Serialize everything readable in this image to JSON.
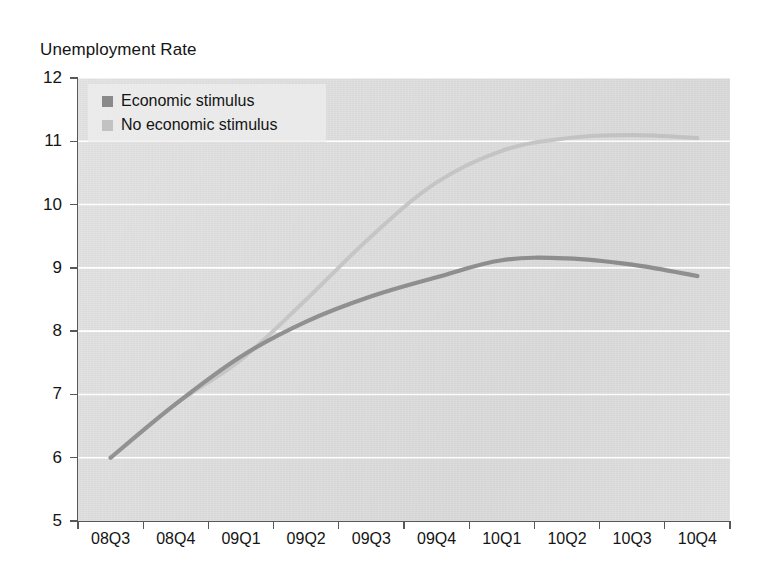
{
  "chart_data": {
    "type": "line",
    "title": "Unemployment Rate",
    "xlabel": "",
    "ylabel": "",
    "categories": [
      "08Q3",
      "08Q4",
      "09Q1",
      "09Q2",
      "09Q3",
      "09Q4",
      "10Q1",
      "10Q2",
      "10Q3",
      "10Q4"
    ],
    "series": [
      {
        "name": "Economic stimulus",
        "color": "#8a8a8a",
        "values": [
          6.0,
          6.85,
          7.6,
          8.15,
          8.55,
          8.85,
          9.12,
          9.15,
          9.05,
          8.87
        ]
      },
      {
        "name": "No economic stimulus",
        "color": "#c2c2c2",
        "values": [
          6.0,
          6.85,
          7.55,
          8.5,
          9.5,
          10.35,
          10.85,
          11.05,
          11.1,
          11.05
        ]
      }
    ],
    "ylim": [
      5,
      12
    ],
    "yticks": [
      5,
      6,
      7,
      8,
      9,
      10,
      11,
      12
    ],
    "ytick_labels": [
      "5",
      "6",
      "7",
      "8",
      "9",
      "10",
      "11",
      "12"
    ],
    "grid": true,
    "grid_axis": "y",
    "grid_color": "#ffffff",
    "plot_background": "#dddddd",
    "figure_background": "#ffffff",
    "legend_position": "top-left"
  },
  "legend": {
    "items": [
      {
        "label": "Economic stimulus",
        "color": "#8a8a8a"
      },
      {
        "label": "No economic stimulus",
        "color": "#c2c2c2"
      }
    ]
  },
  "geometry": {
    "plot_left": 78,
    "plot_top": 78,
    "plot_width": 652,
    "plot_height": 443
  }
}
